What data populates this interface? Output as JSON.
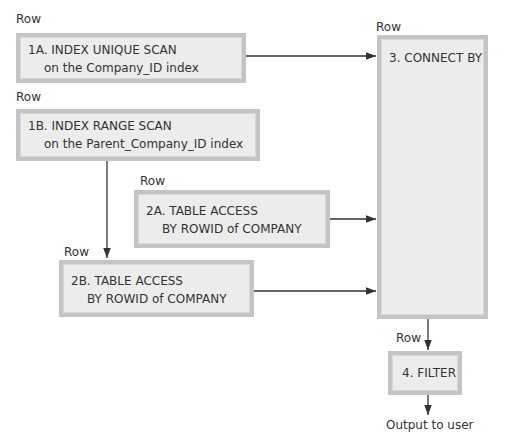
{
  "diagram": {
    "nodes": [
      {
        "id": "1A",
        "row_label": "Row",
        "line1": "1A. INDEX UNIQUE SCAN",
        "line2": "on the Company_ID index"
      },
      {
        "id": "1B",
        "row_label": "Row",
        "line1": "1B. INDEX RANGE SCAN",
        "line2": "on the Parent_Company_ID index"
      },
      {
        "id": "2A",
        "row_label": "Row",
        "line1": "2A. TABLE ACCESS",
        "line2": "BY ROWID of COMPANY"
      },
      {
        "id": "2B",
        "row_label": "Row",
        "line1": "2B. TABLE ACCESS",
        "line2": "BY ROWID of COMPANY"
      },
      {
        "id": "3",
        "row_label": "Row",
        "line1": "3. CONNECT BY"
      },
      {
        "id": "4",
        "row_label": "Row",
        "line1": "4. FILTER"
      }
    ],
    "edges": [
      {
        "from": "1A",
        "to": "3"
      },
      {
        "from": "1B",
        "to": "2B"
      },
      {
        "from": "2A",
        "to": "3"
      },
      {
        "from": "2B",
        "to": "3"
      },
      {
        "from": "3",
        "to": "4"
      },
      {
        "from": "4",
        "to": "output"
      }
    ],
    "output_label": "Output to user",
    "colors": {
      "box_fill": "#ececec",
      "box_border": "#c4c4c4",
      "line": "#333333"
    }
  }
}
